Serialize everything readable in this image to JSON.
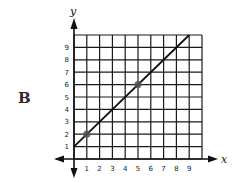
{
  "figure": {
    "label": "B"
  },
  "chart_data": {
    "type": "line",
    "title": "",
    "xlabel": "x",
    "ylabel": "y",
    "xlim": [
      0,
      10
    ],
    "ylim": [
      0,
      10
    ],
    "grid": true,
    "x_ticks": [
      "1",
      "2",
      "3",
      "4",
      "5",
      "6",
      "7",
      "8",
      "9"
    ],
    "y_ticks": [
      "1",
      "2",
      "3",
      "4",
      "5",
      "6",
      "7",
      "8",
      "9"
    ],
    "series": [
      {
        "name": "line",
        "equation": "y = x + 1",
        "x": [
          0,
          9
        ],
        "y": [
          1,
          10
        ],
        "color": "#111111"
      }
    ],
    "points": [
      {
        "x": 1,
        "y": 2
      },
      {
        "x": 5,
        "y": 6
      }
    ],
    "point_color": "#555555"
  }
}
